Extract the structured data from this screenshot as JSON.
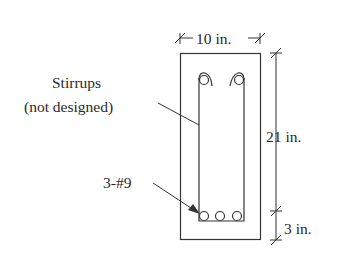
{
  "diagram": {
    "type": "beam-cross-section",
    "labels": {
      "width": "10 in.",
      "depth": "21 in.",
      "cover": "3 in.",
      "stirrups_line1": "Stirrups",
      "stirrups_line2": "(not designed)",
      "bars": "3-#9"
    },
    "colors": {
      "stroke": "#333333",
      "background": "#ffffff"
    }
  }
}
